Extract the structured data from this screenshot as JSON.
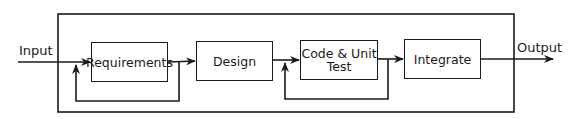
{
  "diagram": {
    "input_label": "Input",
    "output_label": "Output",
    "stages": [
      {
        "label": "Requirements"
      },
      {
        "label": "Design"
      },
      {
        "label": "Code & Unit\nTest",
        "line1": "Code & Unit",
        "line2": "Test"
      },
      {
        "label": "Integrate"
      }
    ],
    "feedback_loops": [
      {
        "from": "Requirements",
        "to": "Requirements"
      },
      {
        "from": "Code & Unit Test",
        "to": "Code & Unit Test"
      }
    ],
    "colors": {
      "line": "#1a1a1a",
      "background": "#ffffff"
    }
  }
}
